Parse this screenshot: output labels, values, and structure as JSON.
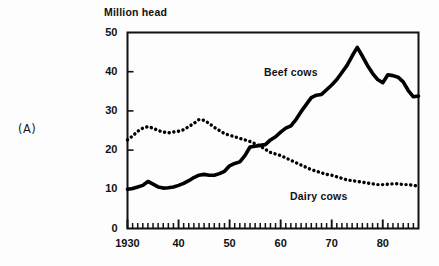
{
  "panel": {
    "label": "(A)"
  },
  "chart_data": {
    "type": "line",
    "title": "",
    "subtitle": "",
    "xlabel": "",
    "ylabel": "Million head",
    "xlim": [
      1930,
      1987
    ],
    "ylim": [
      0,
      50
    ],
    "grid": false,
    "legend_position": "inline-annotation",
    "y_ticks": [
      0,
      10,
      20,
      30,
      40,
      50
    ],
    "y_tick_labels": [
      "0",
      "10",
      "20",
      "30",
      "40",
      "50"
    ],
    "x_ticks": [
      1930,
      1940,
      1950,
      1960,
      1970,
      1980
    ],
    "x_tick_labels": [
      "1930",
      "40",
      "50",
      "60",
      "70",
      "80"
    ],
    "x_minor_tick_interval": 1,
    "annotations": [
      {
        "name": "beef-cows-label",
        "text": "Beef cows"
      },
      {
        "name": "dairy-cows-label",
        "text": "Dairy cows"
      }
    ],
    "series": [
      {
        "name": "Beef cows",
        "style": "solid",
        "color": "#000000",
        "x": [
          1930,
          1931,
          1932,
          1933,
          1934,
          1935,
          1936,
          1937,
          1938,
          1939,
          1940,
          1941,
          1942,
          1943,
          1944,
          1945,
          1946,
          1947,
          1948,
          1949,
          1950,
          1951,
          1952,
          1953,
          1954,
          1955,
          1956,
          1957,
          1958,
          1959,
          1960,
          1961,
          1962,
          1963,
          1964,
          1965,
          1966,
          1967,
          1968,
          1969,
          1970,
          1971,
          1972,
          1973,
          1974,
          1975,
          1976,
          1977,
          1978,
          1979,
          1980,
          1981,
          1982,
          1983,
          1984,
          1985,
          1986,
          1987
        ],
        "values": [
          10.0,
          10.2,
          10.6,
          11.0,
          12.0,
          11.3,
          10.6,
          10.3,
          10.4,
          10.6,
          11.0,
          11.5,
          12.2,
          13.0,
          13.6,
          13.8,
          13.6,
          13.6,
          14.0,
          14.6,
          16.0,
          16.6,
          17.0,
          18.6,
          20.8,
          21.0,
          21.2,
          21.4,
          22.6,
          23.4,
          24.6,
          25.6,
          26.2,
          27.8,
          29.8,
          31.6,
          33.4,
          34.0,
          34.2,
          35.4,
          36.6,
          38.0,
          39.8,
          41.6,
          44.0,
          46.2,
          44.0,
          41.6,
          39.6,
          38.0,
          37.2,
          39.2,
          39.0,
          38.6,
          37.4,
          35.2,
          33.6,
          33.8
        ]
      },
      {
        "name": "Dairy cows",
        "style": "dotted",
        "color": "#000000",
        "x": [
          1930,
          1931,
          1932,
          1933,
          1934,
          1935,
          1936,
          1937,
          1938,
          1939,
          1940,
          1941,
          1942,
          1943,
          1944,
          1945,
          1946,
          1947,
          1948,
          1949,
          1950,
          1951,
          1952,
          1953,
          1954,
          1955,
          1956,
          1957,
          1958,
          1959,
          1960,
          1961,
          1962,
          1963,
          1964,
          1965,
          1966,
          1967,
          1968,
          1969,
          1970,
          1971,
          1972,
          1973,
          1974,
          1975,
          1976,
          1977,
          1978,
          1979,
          1980,
          1981,
          1982,
          1983,
          1984,
          1985,
          1986,
          1987
        ],
        "values": [
          22.6,
          23.6,
          24.8,
          25.6,
          26.0,
          25.6,
          25.0,
          24.6,
          24.4,
          24.6,
          24.8,
          25.2,
          26.0,
          26.8,
          27.8,
          27.6,
          26.8,
          25.8,
          25.0,
          24.2,
          23.8,
          23.4,
          23.0,
          22.6,
          22.2,
          21.6,
          21.0,
          20.2,
          19.4,
          19.0,
          18.6,
          18.0,
          17.4,
          16.8,
          16.2,
          15.6,
          15.0,
          14.6,
          14.2,
          13.8,
          13.6,
          13.2,
          12.8,
          12.4,
          12.2,
          12.0,
          11.8,
          11.6,
          11.4,
          11.2,
          11.2,
          11.3,
          11.4,
          11.4,
          11.2,
          11.2,
          11.0,
          10.8
        ]
      }
    ]
  }
}
